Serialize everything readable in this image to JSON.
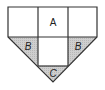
{
  "diagram": {
    "type": "geometric-figure",
    "colors": {
      "stroke": "#333333",
      "shade": "#c8c8c8",
      "background": "#ffffff"
    },
    "regions": [
      {
        "id": "top-left",
        "label": "",
        "shaded": false
      },
      {
        "id": "top-center",
        "label": "A",
        "shaded": false
      },
      {
        "id": "top-right",
        "label": "",
        "shaded": false
      },
      {
        "id": "left-triangle",
        "label": "B",
        "shaded": true
      },
      {
        "id": "center-square",
        "label": "",
        "shaded": false
      },
      {
        "id": "right-triangle",
        "label": "B",
        "shaded": true
      },
      {
        "id": "bottom-triangle",
        "label": "C",
        "shaded": true
      }
    ],
    "labels": {
      "a": "A",
      "b_left": "B",
      "b_right": "B",
      "c": "C"
    }
  }
}
